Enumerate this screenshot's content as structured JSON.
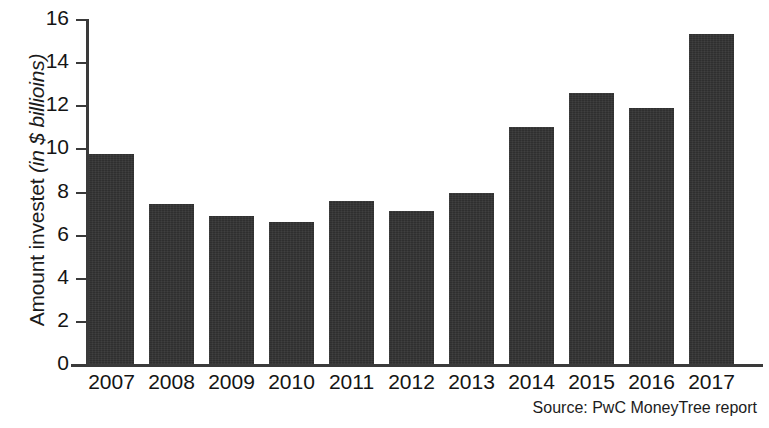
{
  "chart_data": {
    "type": "bar",
    "title": "",
    "subtitle": "",
    "xlabel": "",
    "ylabel": "Amount investet (in $ billioins)",
    "ylabel_main": "Amount investet ",
    "ylabel_unit": "(in $ billioins)",
    "categories": [
      "2007",
      "2008",
      "2009",
      "2010",
      "2011",
      "2012",
      "2013",
      "2014",
      "2015",
      "2016",
      "2017"
    ],
    "values": [
      9.75,
      7.4,
      6.85,
      6.6,
      7.55,
      7.1,
      7.95,
      11.0,
      12.55,
      11.85,
      15.3
    ],
    "series": [
      {
        "name": "Amount invested",
        "values": [
          9.75,
          7.4,
          6.85,
          6.6,
          7.55,
          7.1,
          7.95,
          11.0,
          12.55,
          11.85,
          15.3
        ]
      }
    ],
    "ylim": [
      0,
      16
    ],
    "yticks": [
      0,
      2,
      4,
      6,
      8,
      10,
      12,
      14,
      16
    ],
    "ytick_labels": [
      "0",
      "2",
      "4",
      "6",
      "8",
      "10",
      "12",
      "14",
      "16"
    ],
    "grid": false,
    "legend": false,
    "legend_position": "none",
    "bar_color": "#2f2f2f",
    "axis_color": "#3a3a3a",
    "background_color": "#ffffff",
    "annotations": [
      "Source: PwC MoneyTree report"
    ]
  },
  "source": {
    "text": "Source: PwC MoneyTree report"
  }
}
